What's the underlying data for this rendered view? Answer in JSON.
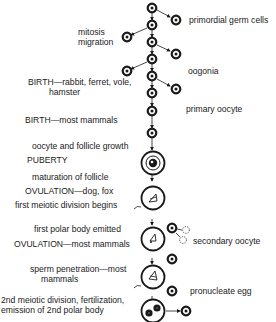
{
  "labels": {
    "primordial": "primordial germ cells",
    "mitosis": "mitosis",
    "migration": "migration",
    "oogonia": "oogonia",
    "birth_early": "BIRTH—rabbit, ferret, vole,",
    "birth_early_2": "hamster",
    "primary_oocyte": "primary oocyte",
    "birth_most": "BIRTH—most mammals",
    "growth": "oocyte and follicle growth",
    "puberty": "PUBERTY",
    "maturation": "maturation of follicle",
    "ovulation_dog": "OVULATION—dog, fox",
    "first_meiotic": "first meiotic division begins",
    "first_polar": "first polar body emitted",
    "ovulation_most": "OVULATION—most mammals",
    "secondary_oocyte": "secondary oocyte",
    "sperm_1": "sperm penetration—most",
    "sperm_2": "mammals",
    "pronucleate": "pronucleate egg",
    "second_meiotic_1": "2nd meiotic division, fertilization,",
    "second_meiotic_2": "emission of 2nd polar body"
  },
  "caption": "2. Major events of oogenesis (figure partially cut off)",
  "colors": {
    "ink": "#1a1a1a",
    "background": "#ffffff"
  }
}
